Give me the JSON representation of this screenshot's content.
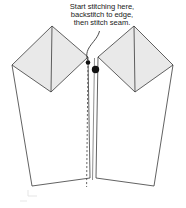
{
  "annotation": {
    "lines": [
      "Start stitching here,",
      "backstitch to edge,",
      "then stitch seam."
    ],
    "line1": "Start stitching here,",
    "line2": "backstitch to edge,",
    "line3": "then stitch seam."
  },
  "markers": {
    "stitch_start_dot": "stitch-start-dot",
    "leader_arrow_tip": "leader-arrow-tip"
  },
  "colors": {
    "flap_fill": "#e9e9e9",
    "body_fill": "#ffffff",
    "outline": "#3a3a3a",
    "dot": "#111111",
    "text": "#1b1b1b",
    "seam_dash": "#4a4a4a",
    "page_background": "#ffffff"
  },
  "geometry": {
    "left_flap_points": "12,65 52,26 88,57 51,92",
    "right_flap_points": "173,65 134,26 98,57 135,92",
    "left_flap_crease": "52,26 51,92",
    "right_flap_crease": "134,26 135,92",
    "left_body_points": "12,65 88,57 90,178 32,186",
    "right_body_points": "173,65 98,57 96,178 154,186",
    "center_seam_solid": "94,58 92,180",
    "center_seam_dashed": "88,62 87,186"
  },
  "leader": {
    "path": "M 99,32 C 96,44 84,48 88,60",
    "arrow_dot_x": 88,
    "arrow_dot_y": 62,
    "start_dot_x": 95,
    "start_dot_y": 69
  }
}
